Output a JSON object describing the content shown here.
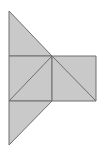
{
  "diagram": {
    "type": "geometric-net",
    "fill": "#c9c9c9",
    "stroke": "#6e6e6e",
    "shapes": [
      {
        "name": "top-triangle",
        "points": "9,11 9,56 52,56"
      },
      {
        "name": "center-square",
        "points": "9,56 52,56 52,101 9,101"
      },
      {
        "name": "right-rectangle",
        "points": "52,56 96,56 96,101 52,101"
      },
      {
        "name": "bottom-triangle",
        "points": "9,101 52,101 9,145"
      }
    ],
    "lines": [
      {
        "name": "center-square-diagonal",
        "x1": 52,
        "y1": 56,
        "x2": 9,
        "y2": 101
      },
      {
        "name": "right-rectangle-diagonal",
        "x1": 52,
        "y1": 56,
        "x2": 96,
        "y2": 101
      }
    ]
  }
}
